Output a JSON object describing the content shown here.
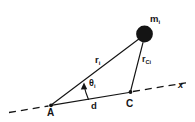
{
  "figure": {
    "background_color": "#ffffff",
    "stroke_color": "#141414",
    "width": 195,
    "height": 122
  },
  "labels": {
    "mass": {
      "base": "m",
      "sub": "i",
      "full": "m_i"
    },
    "r_from_A": {
      "base": "r",
      "sub": "i",
      "full": "r_i"
    },
    "r_from_C": {
      "base": "r",
      "sub": "Ci",
      "full": "r_Ci"
    },
    "angle": {
      "base": "θ",
      "sub": "i",
      "full": "θ_i"
    },
    "distance": {
      "base": "d",
      "sub": "",
      "full": "d"
    },
    "point_A": {
      "base": "A",
      "sub": "",
      "full": "A"
    },
    "point_C": {
      "base": "C",
      "sub": "",
      "full": "C"
    },
    "axis_x": {
      "base": "x",
      "sub": "",
      "full": "x"
    }
  },
  "elements": {
    "mass_marker": "filled-circle-icon",
    "point_A_marker": "dot-icon",
    "point_C_marker": "dot-icon",
    "angle_arc": "angle-arc-arrow-icon",
    "axis_line": "dashed-axis-line",
    "vector_ri": "line-A-to-mass",
    "vector_rci": "line-C-to-mass",
    "segment_d": "line-A-to-C"
  },
  "geometry": {
    "point_A": {
      "x": 51,
      "y": 105
    },
    "point_C": {
      "x": 130,
      "y": 92
    },
    "mass_center": {
      "x": 144.5,
      "y": 34
    },
    "mass_radius": 8.5,
    "axis_start": {
      "x": 9,
      "y": 112
    },
    "axis_end": {
      "x": 186,
      "y": 83
    }
  }
}
